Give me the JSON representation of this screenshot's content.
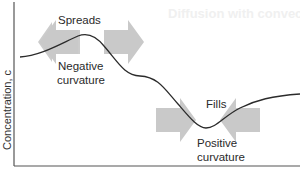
{
  "figure": {
    "title_ghost": "Diffusion with convection",
    "y_axis_label": "Concentration, c",
    "annotations": {
      "peak": {
        "action": "Spreads",
        "curvature_line1": "Negative",
        "curvature_line2": "curvature"
      },
      "trough": {
        "action": "Fills",
        "curvature_line1": "Positive",
        "curvature_line2": "curvature"
      }
    },
    "colors": {
      "curve": "#2b2b2b",
      "arrows": "#c9c9c9",
      "axes": "#555555",
      "text": "#2a2a2a"
    }
  }
}
